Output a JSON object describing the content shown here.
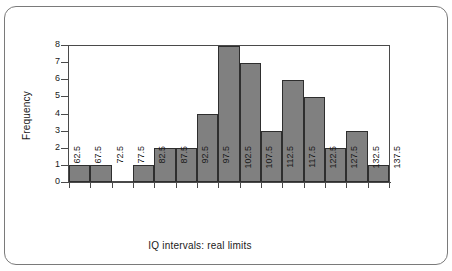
{
  "figure": {
    "outer_border": true,
    "bar_color": "#808080",
    "bar_edge_color": "#2e2e2e",
    "axis_color": "#4a4a4a",
    "text_color": "#1a1a1a",
    "background": "#ffffff"
  },
  "chart_data": {
    "type": "bar",
    "title": "",
    "xlabel": "IQ intervals: real limits",
    "ylabel": "Frequency",
    "categories": [
      "62.5",
      "67.5",
      "72.5",
      "77.5",
      "82.5",
      "87.5",
      "92.5",
      "97.5",
      "102.5",
      "107.5",
      "112.5",
      "117.5",
      "122.5",
      "127.5",
      "132.5"
    ],
    "bin_edges": [
      "62.5",
      "67.5",
      "72.5",
      "77.5",
      "82.5",
      "87.5",
      "92.5",
      "97.5",
      "102.5",
      "107.5",
      "112.5",
      "117.5",
      "122.5",
      "127.5",
      "132.5",
      "137.5"
    ],
    "values": [
      1,
      1,
      0,
      1,
      2,
      2,
      4,
      8,
      7,
      3,
      6,
      5,
      2,
      3,
      1
    ],
    "xtick_labels": [
      "62.5",
      "67.5",
      "72.5",
      "77.5",
      "82.5",
      "87.5",
      "92.5",
      "97.5",
      "102.5",
      "107.5",
      "112.5",
      "117.5",
      "122.5",
      "127.5",
      "132.5",
      "137.5"
    ],
    "ytick_labels": [
      "0",
      "1",
      "2",
      "3",
      "4",
      "5",
      "6",
      "7",
      "8"
    ],
    "ylim": [
      0,
      8
    ],
    "grid": false,
    "legend": null,
    "bar_gap": 0
  }
}
